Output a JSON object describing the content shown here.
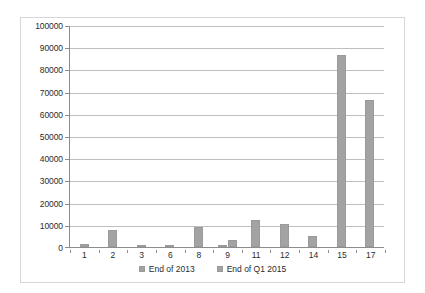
{
  "chart_data": {
    "type": "bar",
    "title": "",
    "subtitle": "",
    "xlabel": "",
    "ylabel": "",
    "ylim": [
      0,
      100000
    ],
    "ytick_step": 10000,
    "yticks": [
      "0",
      "10000",
      "20000",
      "30000",
      "40000",
      "50000",
      "60000",
      "70000",
      "80000",
      "90000",
      "100000"
    ],
    "grid": true,
    "legend_position": "bottom",
    "categories": [
      "1",
      "2",
      "3",
      "6",
      "8",
      "9",
      "11",
      "12",
      "14",
      "15",
      "17"
    ],
    "series": [
      {
        "name": "End of 2013",
        "color": "#a3a3a3",
        "values": [
          1400,
          7800,
          900,
          1000,
          9000,
          500,
          12000,
          10200,
          5000,
          87000,
          66500
        ]
      },
      {
        "name": "End of Q1 2015",
        "color": "#a3a3a3",
        "values": [
          null,
          null,
          null,
          null,
          null,
          3000,
          null,
          null,
          null,
          null,
          null
        ]
      }
    ],
    "bar_color": "#a3a3a3",
    "gridline_color": "#bfbfbf",
    "axis_color": "#8c8c8c",
    "border_color": "#d6d6d6",
    "text_color": "#2b2b2b",
    "background": "#ffffff"
  },
  "legend": {
    "items": [
      {
        "label": "End of 2013",
        "marker": "square-swatch"
      },
      {
        "label": "End of Q1 2015",
        "marker": "square-swatch"
      }
    ]
  }
}
